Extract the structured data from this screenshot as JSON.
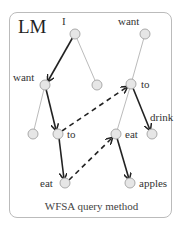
{
  "title": "LM",
  "caption": "WFSA query method",
  "labels": {
    "I": "I",
    "want_right": "want",
    "want_left": "want",
    "to_right": "to",
    "to_mid": "to",
    "eat_mid": "eat",
    "drink": "drink",
    "eat_bottom": "eat",
    "apples": "apples"
  },
  "colors": {
    "node_fill": "#e6e6e6",
    "node_stroke": "#aaa",
    "tree_edge": "#bbb",
    "path_edge": "#222"
  }
}
